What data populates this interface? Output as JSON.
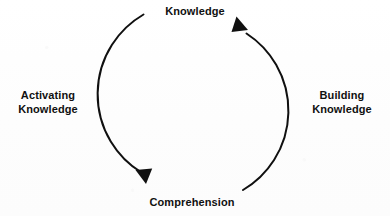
{
  "diagram": {
    "type": "cycle",
    "title": "",
    "background_color": "#ffffff",
    "stroke_color": "#101010",
    "nodes": [
      {
        "id": "knowledge",
        "label": "Knowledge",
        "position": "top"
      },
      {
        "id": "comprehension",
        "label": "Comprehension",
        "position": "bottom"
      }
    ],
    "edges": [
      {
        "id": "activating-knowledge",
        "label": "Activating\nKnowledge",
        "label_line_1": "Activating",
        "label_line_2": "Knowledge",
        "position": "left",
        "from": "knowledge",
        "to": "comprehension",
        "direction": "clockwise-left-descending",
        "arrowhead": "at-comprehension"
      },
      {
        "id": "building-knowledge",
        "label": "Building\nKnowledge",
        "label_line_1": "Building",
        "label_line_2": "Knowledge",
        "position": "right",
        "from": "comprehension",
        "to": "knowledge",
        "direction": "clockwise-right-ascending",
        "arrowhead": "at-knowledge"
      }
    ],
    "geometry": {
      "center_x": 189,
      "center_y": 102,
      "radius": 92,
      "stroke_width": 2
    }
  }
}
